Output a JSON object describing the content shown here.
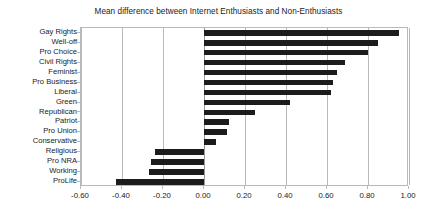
{
  "chart_data": {
    "type": "bar",
    "orientation": "horizontal",
    "title": "Mean difference between Internet Enthusiasts and Non-Enthusiasts",
    "xlabel": "",
    "ylabel": "",
    "xlim": [
      -0.6,
      1.0
    ],
    "xticks": [
      -0.6,
      -0.4,
      -0.2,
      0.0,
      0.2,
      0.4,
      0.6,
      0.8,
      1.0
    ],
    "xtick_labels": [
      "-0.60",
      "-0.40",
      "-0.20",
      "0.00",
      "0.20",
      "0.40",
      "0.60",
      "0.80",
      "1.00"
    ],
    "grid": true,
    "grid_axis": "x",
    "legend": false,
    "bar_color": "#1c1c1c",
    "grid_color": "#b9b9b9",
    "categories": [
      "Gay Rights",
      "Well-off",
      "Pro Choice",
      "Civil Rights",
      "Feminist",
      "Pro Business",
      "Liberal",
      "Green",
      "Republican",
      "Patriot",
      "Pro Union",
      "Conservative",
      "Religious",
      "Pro NRA",
      "Working",
      "ProLife"
    ],
    "values": [
      0.95,
      0.85,
      0.8,
      0.69,
      0.65,
      0.63,
      0.62,
      0.42,
      0.25,
      0.12,
      0.11,
      0.06,
      -0.24,
      -0.26,
      -0.27,
      -0.43
    ]
  }
}
